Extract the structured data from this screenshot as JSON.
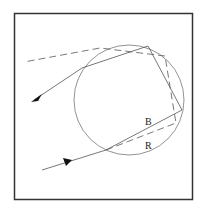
{
  "diagram": {
    "type": "rainbow-ray-path-through-droplet",
    "colors": {
      "background": "#ffffff",
      "frame": "#333333",
      "circle": "#777777",
      "ray": "#555555",
      "arrow": "#111111"
    },
    "labels": {
      "blue_ray": "B",
      "red_ray": "R"
    }
  }
}
